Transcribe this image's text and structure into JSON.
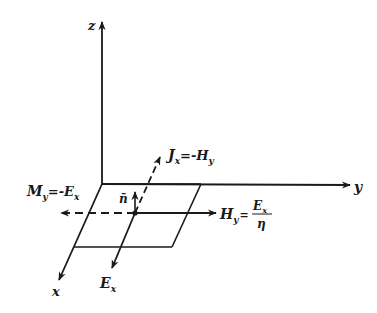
{
  "diagram": {
    "axes": {
      "z": "z",
      "y": "y",
      "x": "x"
    },
    "labels": {
      "J": {
        "main": "J",
        "sub": "x",
        "rest": "=-H",
        "rest_sub": "y"
      },
      "M": {
        "main": "M",
        "sub": "y",
        "rest": "=-E",
        "rest_sub": "x"
      },
      "H": {
        "main": "H",
        "sub": "y",
        "eq": "=",
        "num": "E",
        "num_sub": "x",
        "den": "η"
      },
      "E": {
        "main": "E",
        "sub": "x"
      },
      "n": "n̄"
    },
    "colors": {
      "ink": "#1a1a1a",
      "background": "#ffffff"
    }
  }
}
